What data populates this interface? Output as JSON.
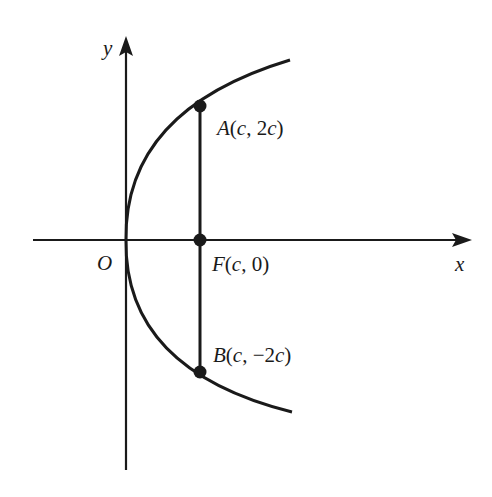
{
  "diagram": {
    "type": "parabola",
    "equation_implied": "y^2 = 4cx",
    "axes": {
      "x_label": "x",
      "y_label": "y",
      "origin_label": "O"
    },
    "points": [
      {
        "id": "A",
        "label": "A(c, 2c)",
        "name": "A",
        "coords": "(c, 2c)"
      },
      {
        "id": "F",
        "label": "F(c, 0)",
        "name": "F",
        "coords": "(c, 0)"
      },
      {
        "id": "B",
        "label": "B(c, −2c)",
        "name": "B",
        "coords": "(c, −2c)"
      }
    ],
    "segments": [
      {
        "from": "A",
        "to": "B",
        "description": "latus rectum through focus F"
      }
    ],
    "colors": {
      "stroke": "#1a1a1a",
      "background": "#ffffff"
    }
  }
}
